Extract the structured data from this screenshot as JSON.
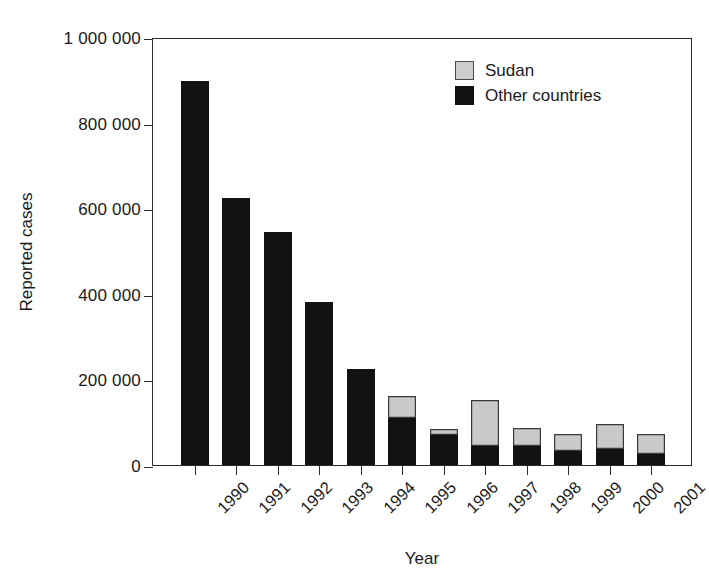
{
  "chart_data": {
    "type": "bar",
    "subtype": "stacked-vertical",
    "title": "",
    "xlabel": "Year",
    "ylabel": "Reported cases",
    "categories": [
      "1990",
      "1991",
      "1992",
      "1993",
      "1994",
      "1995",
      "1996",
      "1997",
      "1998",
      "1999",
      "2000",
      "2001"
    ],
    "series": [
      {
        "name": "Other countries",
        "color": "#121212",
        "values": [
          897000,
          624000,
          544000,
          380000,
          224000,
          110000,
          70000,
          44000,
          44000,
          33000,
          37000,
          26000
        ]
      },
      {
        "name": "Sudan",
        "color": "#c9c9c9",
        "values": [
          0,
          0,
          0,
          0,
          0,
          51000,
          14000,
          108000,
          42000,
          39000,
          59000,
          46000
        ]
      }
    ],
    "totals": [
      897000,
      624000,
      544000,
      380000,
      224000,
      161000,
      84000,
      152000,
      86000,
      72000,
      96000,
      72000
    ],
    "ylim": [
      0,
      1000000
    ],
    "yticks": [
      0,
      200000,
      400000,
      600000,
      800000,
      1000000
    ],
    "ytick_labels": [
      "0",
      "200 000",
      "400 000",
      "600 000",
      "800 000",
      "1 000 000"
    ],
    "grid": false,
    "legend_position": "top-right",
    "stack_order_bottom_to_top": [
      "Other countries",
      "Sudan"
    ]
  },
  "axes": {
    "y_title": "Reported cases",
    "x_title": "Year",
    "y_tick_labels": [
      "0",
      "200 000",
      "400 000",
      "600 000",
      "800 000",
      "1 000 000"
    ],
    "x_tick_labels": [
      "1990",
      "1991",
      "1992",
      "1993",
      "1994",
      "1995",
      "1996",
      "1997",
      "1998",
      "1999",
      "2000",
      "2001"
    ]
  },
  "legend": {
    "items": [
      {
        "label": "Sudan",
        "swatch": "sudan-swatch",
        "color": "#cdcdcd"
      },
      {
        "label": "Other countries",
        "swatch": "other-countries-swatch",
        "color": "#111111"
      }
    ]
  }
}
